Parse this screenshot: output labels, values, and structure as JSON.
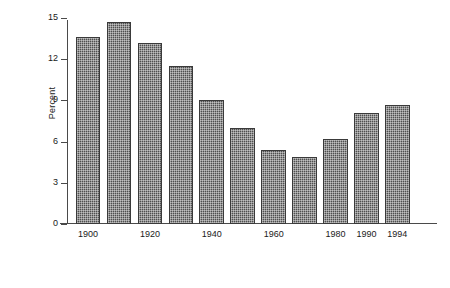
{
  "chart_data": {
    "type": "bar",
    "title": "",
    "subtitle": "",
    "xlabel": "",
    "ylabel": "Percent",
    "categories": [
      "1900",
      "1910",
      "1920",
      "1930",
      "1940",
      "1950",
      "1960",
      "1970",
      "1980",
      "1990",
      "1994"
    ],
    "values": [
      13.6,
      14.7,
      13.2,
      11.5,
      9.0,
      7.0,
      5.4,
      4.9,
      6.2,
      8.1,
      8.7
    ],
    "ylim": [
      0,
      15
    ],
    "yticks": [
      0,
      3,
      6,
      9,
      12,
      15
    ],
    "ytick_labels": [
      "0",
      "3",
      "6",
      "9",
      "12",
      "15"
    ],
    "xtick_labels": [
      "1900",
      "1920",
      "1940",
      "1960",
      "1980",
      "1990",
      "1994"
    ],
    "xtick_categories": [
      "1900",
      "1920",
      "1940",
      "1960",
      "1980",
      "1990",
      "1994"
    ],
    "grid": false,
    "legend": false,
    "bar_color": "#4f4f4f",
    "bar_edge_color": "#3a3a3a",
    "axis_color": "#4a4a4a",
    "background_color": "#ffffff"
  }
}
